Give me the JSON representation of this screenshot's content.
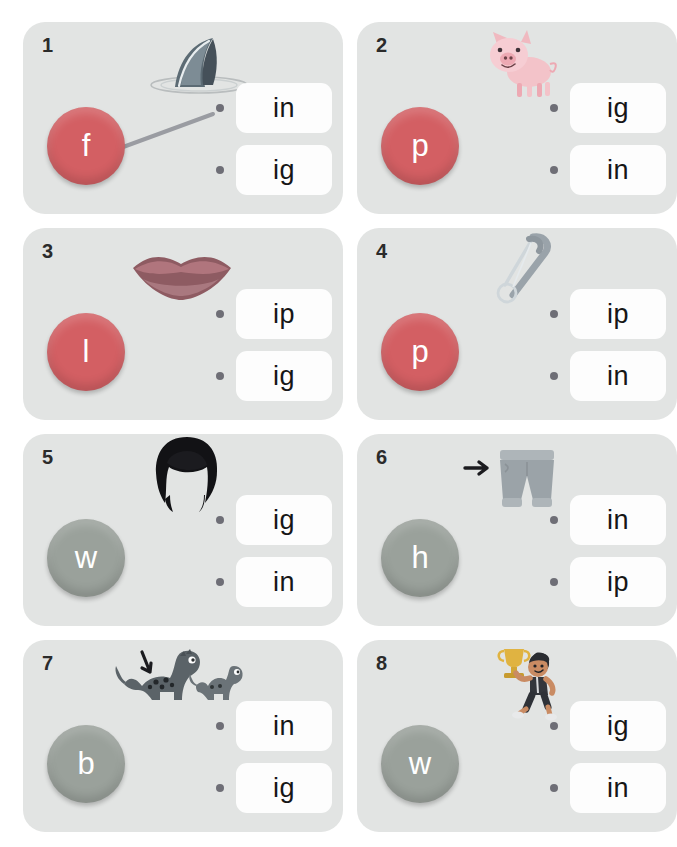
{
  "worksheet": {
    "background_color": "#ffffff",
    "card_background": "#e2e4e3",
    "option_box_color": "#fdfdfd",
    "dot_color": "#6e6e76"
  },
  "cards": [
    {
      "number": "1",
      "picture_name": "shark-fin-image",
      "letter": "f",
      "letter_color": "#d35f63",
      "options": [
        "in",
        "ig"
      ],
      "connected_option_index": 0
    },
    {
      "number": "2",
      "picture_name": "pig-image",
      "letter": "p",
      "letter_color": "#d35f63",
      "options": [
        "ig",
        "in"
      ],
      "connected_option_index": -1
    },
    {
      "number": "3",
      "picture_name": "lips-image",
      "letter": "l",
      "letter_color": "#d35f63",
      "options": [
        "ip",
        "ig"
      ],
      "connected_option_index": -1
    },
    {
      "number": "4",
      "picture_name": "safety-pin-image",
      "letter": "p",
      "letter_color": "#d35f63",
      "options": [
        "ip",
        "in"
      ],
      "connected_option_index": -1
    },
    {
      "number": "5",
      "picture_name": "wig-image",
      "letter": "w",
      "letter_color": "#9aa19b",
      "options": [
        "ig",
        "in"
      ],
      "connected_option_index": -1
    },
    {
      "number": "6",
      "picture_name": "shorts-hip-image",
      "letter": "h",
      "letter_color": "#9aa19b",
      "options": [
        "in",
        "ip"
      ],
      "connected_option_index": -1
    },
    {
      "number": "7",
      "picture_name": "dinosaurs-big-image",
      "letter": "b",
      "letter_color": "#9aa19b",
      "options": [
        "in",
        "ig"
      ],
      "connected_option_index": -1
    },
    {
      "number": "8",
      "picture_name": "boy-trophy-win-image",
      "letter": "w",
      "letter_color": "#9aa19b",
      "options": [
        "ig",
        "in"
      ],
      "connected_option_index": -1
    }
  ]
}
